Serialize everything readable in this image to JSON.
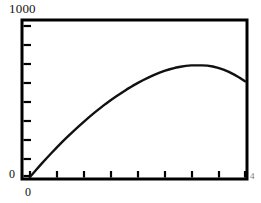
{
  "figure": {
    "name": "concave-production-curve-plot",
    "background_color": "#ffffff",
    "frame_color": "#000000",
    "curve_color": "#111111"
  },
  "labels": {
    "y_top": "1000",
    "y_bottom": "0",
    "x_origin": "0",
    "x_right": "4"
  },
  "chart_data": {
    "type": "line",
    "title": "",
    "subtitle": "",
    "xlabel": "",
    "ylabel": "",
    "legend": [],
    "grid": false,
    "legend_position": "none",
    "xlim": [
      0,
      4
    ],
    "ylim": [
      0,
      1000
    ],
    "x_tick_labels": [
      "0",
      "",
      "",
      "",
      "",
      "",
      "",
      "",
      ""
    ],
    "y_tick_labels": [
      "0",
      "",
      "",
      "",
      "",
      "",
      "",
      "",
      "1000"
    ],
    "x_ticks": [
      0,
      0.5,
      1.0,
      1.5,
      2.0,
      2.5,
      3.0,
      3.5,
      4.0
    ],
    "y_ticks": [
      0,
      125,
      250,
      375,
      500,
      625,
      750,
      875,
      1000
    ],
    "series": [
      {
        "name": "curve",
        "x": [
          0.0,
          0.1,
          0.2,
          0.3,
          0.4,
          0.5,
          0.6,
          0.7,
          0.8,
          0.9,
          1.0,
          1.1,
          1.2,
          1.3,
          1.4,
          1.5,
          1.6,
          1.7,
          1.8,
          1.9,
          2.0,
          2.1,
          2.2,
          2.3,
          2.4,
          2.5,
          2.6,
          2.7,
          2.8,
          2.9,
          3.0,
          3.1,
          3.2,
          3.3,
          3.4,
          3.5,
          3.6,
          3.7,
          3.8,
          3.9,
          4.0
        ],
        "y": [
          0,
          52,
          103,
          152,
          200,
          247,
          292,
          336,
          379,
          420,
          460,
          499,
          536,
          572,
          607,
          640,
          671,
          701,
          730,
          757,
          782,
          806,
          828,
          849,
          867,
          884,
          898,
          910,
          919,
          926,
          930,
          930,
          930,
          928,
          921,
          910,
          895,
          876,
          853,
          827,
          797
        ]
      }
    ]
  }
}
